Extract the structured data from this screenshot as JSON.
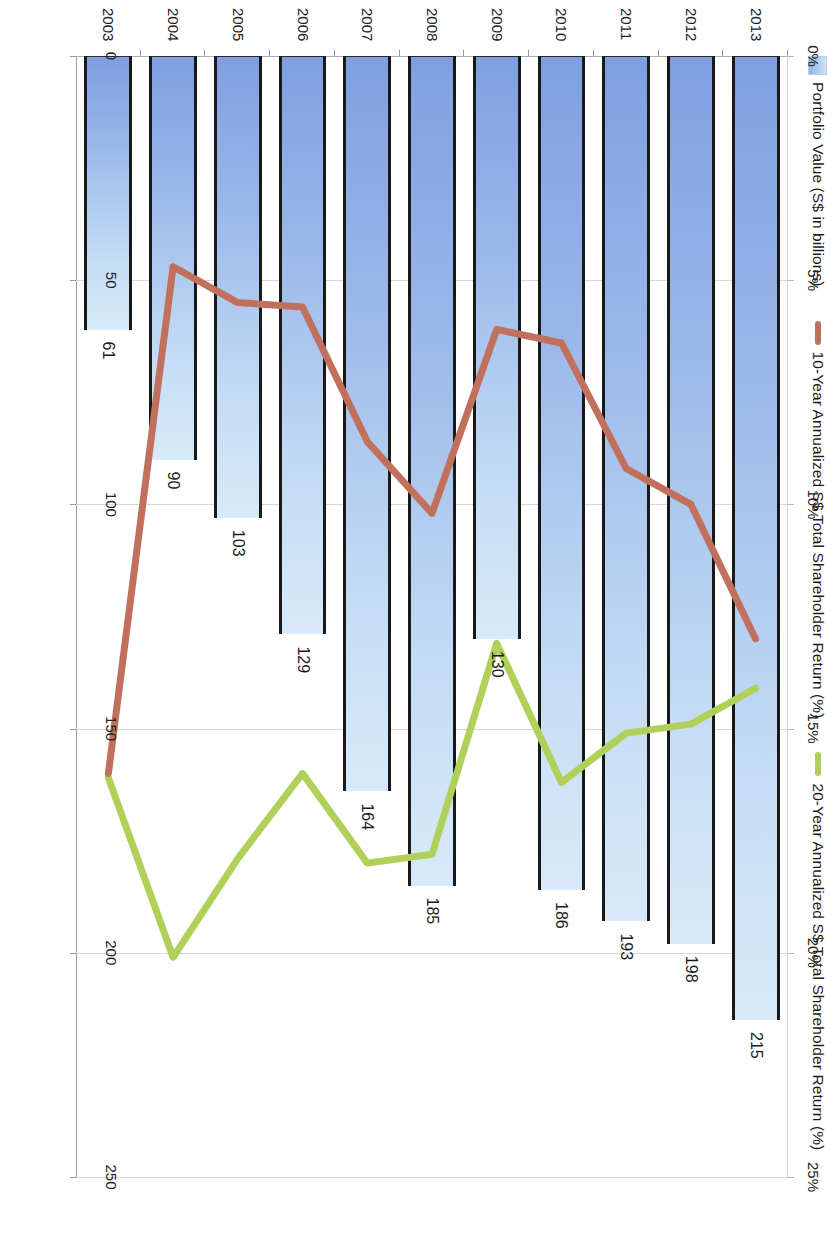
{
  "legend": {
    "items": [
      {
        "name": "portfolio-value",
        "label": "Portfolio Value (S$ in billions)",
        "type": "bar",
        "color": "#9cbce9"
      },
      {
        "name": "tsr-10yr",
        "label": "10-Year Annualized S$ Total Shareholder Return (%)",
        "type": "line",
        "color": "#c0705c"
      },
      {
        "name": "tsr-20yr",
        "label": "20-Year Annualized S$ Total Shareholder Return (%)",
        "type": "line",
        "color": "#b0d05a"
      }
    ]
  },
  "axes": {
    "category": {
      "labels": [
        "2003",
        "2004",
        "2005",
        "2006",
        "2007",
        "2008",
        "2009",
        "2010",
        "2011",
        "2012",
        "2013"
      ]
    },
    "primary": {
      "title": "",
      "ticks": [
        "0",
        "50",
        "100",
        "150",
        "200",
        "250"
      ],
      "min": 0,
      "max": 250,
      "step": 50
    },
    "secondary": {
      "title": "",
      "ticks": [
        "0%",
        "5%",
        "10%",
        "15%",
        "20%",
        "25%"
      ],
      "min": 0,
      "max": 25,
      "step": 5
    }
  },
  "chart_data": {
    "type": "bar",
    "title": "",
    "subtitle": "",
    "xlabel": "",
    "ylabel": "Portfolio Value (S$ in billions)",
    "y2label": "Annualized S$ Total Shareholder Return (%)",
    "ylim": [
      0,
      250
    ],
    "y2lim": [
      0,
      25
    ],
    "grid": true,
    "legend_position": "top-left",
    "orientation": "horizontal-bars",
    "categories": [
      "2003",
      "2004",
      "2005",
      "2006",
      "2007",
      "2008",
      "2009",
      "2010",
      "2011",
      "2012",
      "2013"
    ],
    "series": [
      {
        "name": "Portfolio Value (S$ in billions)",
        "type": "bar",
        "axis": "primary",
        "unit": "S$ billions",
        "color": "#9cbce9",
        "values": [
          61,
          90,
          103,
          129,
          164,
          185,
          130,
          186,
          193,
          198,
          215
        ],
        "data_labels": [
          "61",
          "90",
          "103",
          "129",
          "164",
          "185",
          "130",
          "186",
          "193",
          "198",
          "215"
        ]
      },
      {
        "name": "10-Year Annualized S$ Total Shareholder Return (%)",
        "type": "line",
        "axis": "secondary",
        "unit": "%",
        "color": "#c0705c",
        "values": [
          16.0,
          4.7,
          5.5,
          5.6,
          8.6,
          10.2,
          6.1,
          6.4,
          9.2,
          10.0,
          13.0
        ]
      },
      {
        "name": "20-Year Annualized S$ Total Shareholder Return (%)",
        "type": "line",
        "axis": "secondary",
        "unit": "%",
        "color": "#b0d05a",
        "values": [
          16.1,
          20.1,
          17.9,
          16.0,
          18.0,
          17.8,
          13.1,
          16.2,
          15.1,
          14.9,
          14.1
        ]
      }
    ]
  }
}
